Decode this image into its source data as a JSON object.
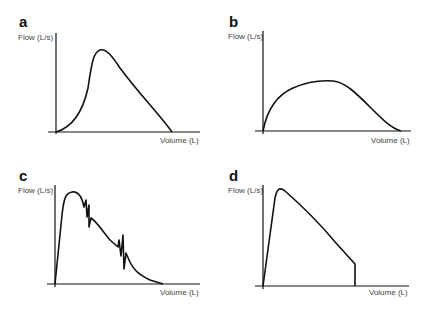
{
  "panels": [
    {
      "id": "a",
      "letter": "a",
      "ylabel": "Flow (L/s)",
      "xlabel": "Volume (L)",
      "description": "normal flow-volume curve with slow rise"
    },
    {
      "id": "b",
      "letter": "b",
      "ylabel": "Flow (L/s)",
      "xlabel": "Volume (L)",
      "description": "flattened plateau curve"
    },
    {
      "id": "c",
      "letter": "c",
      "ylabel": "Flow (L/s)",
      "xlabel": "Volume (L)",
      "description": "curve with cough artifacts"
    },
    {
      "id": "d",
      "letter": "d",
      "ylabel": "Flow (L/s)",
      "xlabel": "Volume (L)",
      "description": "curve with early termination"
    }
  ],
  "colors": {
    "axis": "#111111",
    "curve": "#111111",
    "label": "#444444"
  }
}
